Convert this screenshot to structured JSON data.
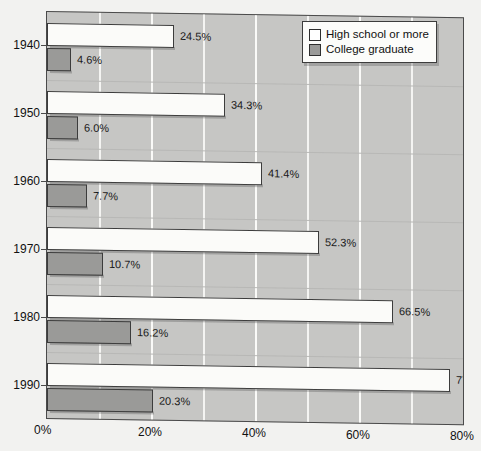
{
  "chart_data": {
    "type": "bar",
    "orientation": "horizontal",
    "title": "",
    "subtitle": "",
    "xlabel": "",
    "ylabel": "",
    "categories": [
      "1940",
      "1950",
      "1960",
      "1970",
      "1980",
      "1990"
    ],
    "series": [
      {
        "name": "High school or more",
        "color": "#ffffff",
        "values": [
          24.5,
          34.3,
          41.4,
          52.3,
          66.5,
          77.6
        ],
        "value_labels": [
          "24.5%",
          "34.3%",
          "41.4%",
          "52.3%",
          "66.5%",
          "77.6%"
        ]
      },
      {
        "name": "College graduate",
        "color": "#9a9a98",
        "values": [
          4.6,
          6.0,
          7.7,
          10.7,
          16.2,
          20.3
        ],
        "value_labels": [
          "4.6%",
          "6.0%",
          "7.7%",
          "10.7%",
          "16.2%",
          "20.3%"
        ]
      }
    ],
    "xlim": [
      0,
      80.4
    ],
    "xticks": [
      0,
      20,
      40,
      60,
      80
    ],
    "xtick_labels": [
      "0%",
      "20%",
      "40%",
      "60%",
      "80%"
    ],
    "minor_gridlines": [
      10,
      20,
      30,
      40,
      50,
      60,
      70,
      80
    ],
    "grid": true,
    "legend_position": "top-right",
    "plot_background": "#c6c6c4",
    "gridline_color": "#f4f4f2",
    "axis_color": "#4a4a4a"
  },
  "legend": {
    "items": [
      {
        "label": "High school or more",
        "swatch": "hs"
      },
      {
        "label": "College graduate",
        "swatch": "cg"
      }
    ]
  }
}
